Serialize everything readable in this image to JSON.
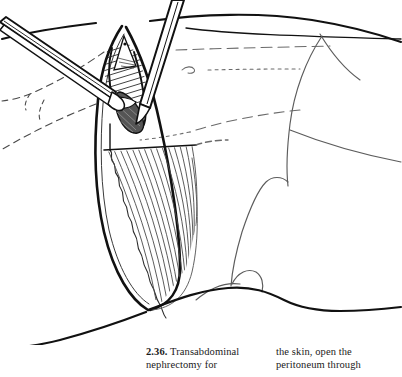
{
  "figure": {
    "number": "2.36.",
    "title_text": "Transabdominal nephrectomy for",
    "continuation_text": "the skin, open the peritoneum through",
    "caption_left_line1_num": "2.36.",
    "caption_left_line1_text": " Transabdominal",
    "caption_left_line2": "nephrectomy for",
    "caption_right_line1": "the skin, open the",
    "caption_right_line2": "peritoneum through",
    "alt": "Line drawing of a transabdominal nephrectomy: a long curved flank incision through abdominal wall muscle, retracted open, with a scalpel and forceps at the upper end of the incision"
  },
  "illustration": {
    "label": "transabdominal-nephrectomy-line-drawing",
    "ink_color": "#111111",
    "light_ink_color": "#6b6b6b",
    "hatch_color": "#2b2b2b",
    "background": "#ffffff",
    "parts": [
      "body-outline",
      "incision-flap",
      "muscle-hatching",
      "dashed-anatomical-landmarks",
      "scalpel",
      "forceps",
      "peritoneal-opening"
    ]
  }
}
